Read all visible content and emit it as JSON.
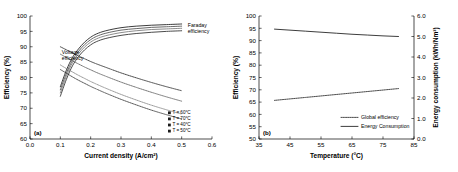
{
  "figure": {
    "panel_a_tag": "(a)",
    "panel_b_tag": "(b)"
  },
  "chart_data": [
    {
      "type": "line",
      "panel": "(a)",
      "title": "",
      "xlabel": "Current density (A/cm²)",
      "ylabel": "Efficiency (%)",
      "xlim": [
        0.0,
        0.6
      ],
      "ylim": [
        60,
        100
      ],
      "xticks": [
        "0.0",
        "0.1",
        "0.2",
        "0.3",
        "0.4",
        "0.5",
        "0.6"
      ],
      "xtick_values": [
        0.0,
        0.1,
        0.2,
        0.3,
        0.4,
        0.5,
        0.6
      ],
      "yticks": [
        "60",
        "65",
        "70",
        "75",
        "80",
        "85",
        "90",
        "95",
        "100"
      ],
      "ytick_values": [
        60,
        65,
        70,
        75,
        80,
        85,
        90,
        95,
        100
      ],
      "grid": false,
      "legend_position": "lower-right",
      "annotations": [
        {
          "text": "Faraday",
          "x": 0.52,
          "y": 96.4
        },
        {
          "text": "efficiency",
          "x": 0.52,
          "y": 94.6
        },
        {
          "text": "Voltage",
          "x": 0.105,
          "y": 87.6
        },
        {
          "text": "efficiency",
          "x": 0.105,
          "y": 85.8
        }
      ],
      "legend": [
        {
          "label": "T = 60°C",
          "marker": "square-filled"
        },
        {
          "label": "T = 70°C",
          "marker": "square-dotted"
        },
        {
          "label": "T = 40°C",
          "marker": "square-hatched"
        },
        {
          "label": "T = 50°C",
          "marker": "square-filled"
        }
      ],
      "x": [
        0.1,
        0.12,
        0.14,
        0.16,
        0.18,
        0.2,
        0.22,
        0.25,
        0.3,
        0.35,
        0.4,
        0.45,
        0.5
      ],
      "series": [
        {
          "name": "Faraday efficiency T = 40°C",
          "style": "solid",
          "values": [
            77.0,
            82.4,
            86.5,
            89.3,
            91.5,
            93.1,
            94.2,
            95.2,
            96.2,
            96.7,
            97.0,
            97.2,
            97.4
          ]
        },
        {
          "name": "Faraday efficiency T = 50°C",
          "style": "solid",
          "values": [
            76.0,
            81.4,
            85.6,
            88.5,
            90.7,
            92.3,
            93.4,
            94.4,
            95.4,
            95.9,
            96.3,
            96.5,
            96.7
          ]
        },
        {
          "name": "Faraday efficiency T = 60°C",
          "style": "solid",
          "values": [
            75.0,
            80.5,
            84.8,
            87.7,
            89.9,
            91.5,
            92.6,
            93.6,
            94.6,
            95.2,
            95.6,
            95.8,
            96.0
          ]
        },
        {
          "name": "Faraday efficiency T = 70°C",
          "style": "solid",
          "values": [
            73.9,
            79.4,
            83.8,
            86.8,
            89.0,
            90.6,
            91.7,
            92.7,
            93.7,
            94.3,
            94.7,
            95.0,
            95.2
          ]
        },
        {
          "name": "Voltage efficiency T = 70°C",
          "style": "dotted",
          "values": [
            90.0,
            89.0,
            88.0,
            87.0,
            86.1,
            85.2,
            84.4,
            83.3,
            81.5,
            79.9,
            78.4,
            77.0,
            75.7
          ]
        },
        {
          "name": "Voltage efficiency T = 60°C",
          "style": "dotted",
          "values": [
            87.6,
            86.5,
            85.4,
            84.4,
            83.4,
            82.5,
            81.6,
            80.4,
            78.5,
            76.8,
            75.2,
            73.7,
            72.3
          ]
        },
        {
          "name": "Voltage efficiency T = 50°C",
          "style": "dotted",
          "values": [
            84.1,
            82.9,
            81.8,
            80.7,
            79.7,
            78.7,
            77.8,
            76.5,
            74.5,
            72.7,
            71.0,
            69.5,
            68.1
          ]
        },
        {
          "name": "Voltage efficiency T = 40°C",
          "style": "dotted",
          "values": [
            82.6,
            81.4,
            80.2,
            79.1,
            78.1,
            77.1,
            76.2,
            74.9,
            72.9,
            71.1,
            69.4,
            67.9,
            66.5
          ]
        }
      ]
    },
    {
      "type": "line",
      "panel": "(b)",
      "title": "",
      "xlabel": "Temperature (°C)",
      "ylabel": "Efficiency (%)",
      "y2label": "Energy consumption (kWh/Nm³)",
      "xlim": [
        35,
        85
      ],
      "ylim": [
        50,
        100
      ],
      "y2lim": [
        0.0,
        6.0
      ],
      "xticks": [
        "35",
        "45",
        "55",
        "65",
        "75",
        "85"
      ],
      "xtick_values": [
        35,
        45,
        55,
        65,
        75,
        85
      ],
      "yticks": [
        "50",
        "55",
        "60",
        "65",
        "70",
        "75",
        "80",
        "85",
        "90",
        "95",
        "100"
      ],
      "ytick_values": [
        50,
        55,
        60,
        65,
        70,
        75,
        80,
        85,
        90,
        95,
        100
      ],
      "y2ticks": [
        "0.0",
        "1.0",
        "2.0",
        "3.0",
        "4.0",
        "5.0",
        "6.0"
      ],
      "y2tick_values": [
        0.0,
        1.0,
        2.0,
        3.0,
        4.0,
        5.0,
        6.0
      ],
      "grid": false,
      "legend_position": "lower-right",
      "legend": [
        {
          "label": "Global efficiency",
          "style": "dotted"
        },
        {
          "label": "Energy Consumption",
          "style": "solid"
        }
      ],
      "x": [
        40,
        45,
        50,
        55,
        60,
        65,
        70,
        75,
        80
      ],
      "series": [
        {
          "name": "Global efficiency",
          "style": "dotted",
          "axis": "left",
          "values": [
            65.7,
            66.3,
            66.9,
            67.5,
            68.1,
            68.7,
            69.3,
            69.9,
            70.5
          ]
        },
        {
          "name": "Energy Consumption",
          "style": "solid",
          "axis": "right",
          "values": [
            5.36,
            5.31,
            5.26,
            5.21,
            5.16,
            5.11,
            5.07,
            5.03,
            5.0
          ]
        }
      ]
    }
  ]
}
